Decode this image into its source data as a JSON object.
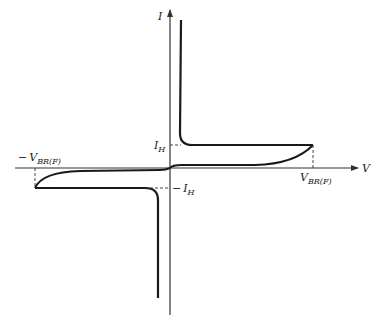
{
  "diagram": {
    "type": "SCR/thyristor-style bidirectional I-V characteristic",
    "axes": {
      "y_label": "I",
      "x_label": "V"
    },
    "labels": {
      "holding_current_pos": {
        "main": "I",
        "sub": "H"
      },
      "holding_current_neg": {
        "prefix": "−",
        "main": "I",
        "sub": "H"
      },
      "breakover_pos": {
        "main": "V",
        "sub": "BR(F)"
      },
      "breakover_neg": {
        "prefix": "−",
        "main": "V",
        "sub": "BR(F)"
      }
    },
    "colors": {
      "curve": "#1a1a1a",
      "axis": "#333333",
      "dashed": "#444444"
    }
  }
}
